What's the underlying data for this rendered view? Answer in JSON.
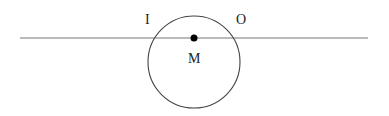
{
  "diagram": {
    "labels": {
      "I": "I",
      "O": "O",
      "M": "M"
    },
    "line": {
      "x1": 20,
      "y1": 38,
      "x2": 368,
      "y2": 38,
      "color": "#777777"
    },
    "circle": {
      "cx": 194,
      "cy": 62,
      "r": 46,
      "color": "#444444"
    },
    "point": {
      "cx": 194,
      "cy": 38,
      "r": 3.5,
      "color": "#000000"
    }
  }
}
